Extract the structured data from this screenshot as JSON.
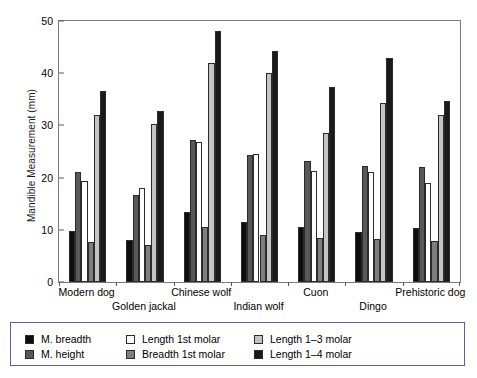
{
  "chart_data": {
    "type": "bar",
    "title": "",
    "subtitle": "",
    "xlabel": "",
    "ylabel": "Mandible Measurement (mm)",
    "ylim": [
      0,
      50
    ],
    "yticks": [
      0,
      10,
      20,
      30,
      40,
      50
    ],
    "ytick_labels": [
      "0",
      "10",
      "20",
      "30",
      "40",
      "50"
    ],
    "grid": false,
    "legend_position": "bottom",
    "categories": [
      "Modern dog",
      "Golden jackal",
      "Chinese wolf",
      "Indian wolf",
      "Cuon",
      "Dingo",
      "Prehistoric dog"
    ],
    "series": [
      {
        "name": "M. breadth",
        "color": "#0d0d0d",
        "values": [
          9.7,
          8.1,
          13.5,
          11.5,
          10.6,
          9.6,
          10.3
        ]
      },
      {
        "name": "M. height",
        "color": "#585858",
        "values": [
          21.0,
          16.7,
          27.3,
          24.3,
          23.2,
          22.3,
          22.1
        ]
      },
      {
        "name": "Length 1st molar",
        "color": "#ffffff",
        "values": [
          19.4,
          18.0,
          26.8,
          24.5,
          21.2,
          21.1,
          19.0
        ]
      },
      {
        "name": "Breadth 1st molar",
        "color": "#7e7e7e",
        "values": [
          7.7,
          7.0,
          10.6,
          9.1,
          8.4,
          8.2,
          7.9
        ]
      },
      {
        "name": "Length 1–3 molar",
        "color": "#c4c4c4",
        "values": [
          32.0,
          30.3,
          41.9,
          40.0,
          28.6,
          34.2,
          32.0
        ]
      },
      {
        "name": "Length 1–4 molar",
        "color": "#1a1a1a",
        "values": [
          36.5,
          32.8,
          48.1,
          44.3,
          37.4,
          42.9,
          34.6
        ]
      }
    ]
  },
  "legend": {
    "entries": [
      {
        "label": "M. breadth",
        "color": "#0d0d0d"
      },
      {
        "label": "M. height",
        "color": "#585858"
      },
      {
        "label": "Length 1st molar",
        "color": "#ffffff"
      },
      {
        "label": "Breadth 1st molar",
        "color": "#7e7e7e"
      },
      {
        "label": "Length 1–3 molar",
        "color": "#c4c4c4"
      },
      {
        "label": "Length 1–4 molar",
        "color": "#1a1a1a"
      }
    ]
  }
}
